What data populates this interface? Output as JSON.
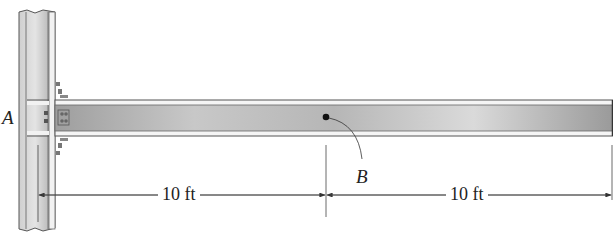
{
  "figure": {
    "labels": {
      "point_a": "A",
      "point_b": "B"
    },
    "dimensions": [
      {
        "label": "10 ft",
        "from": "A",
        "to": "B"
      },
      {
        "label": "10 ft",
        "from": "B",
        "to": "beam-end"
      }
    ],
    "colors": {
      "steel_light": "#e6e6e6",
      "steel_dark": "#a9a9a9",
      "outline": "#555555",
      "dimension_line": "#444444"
    }
  }
}
